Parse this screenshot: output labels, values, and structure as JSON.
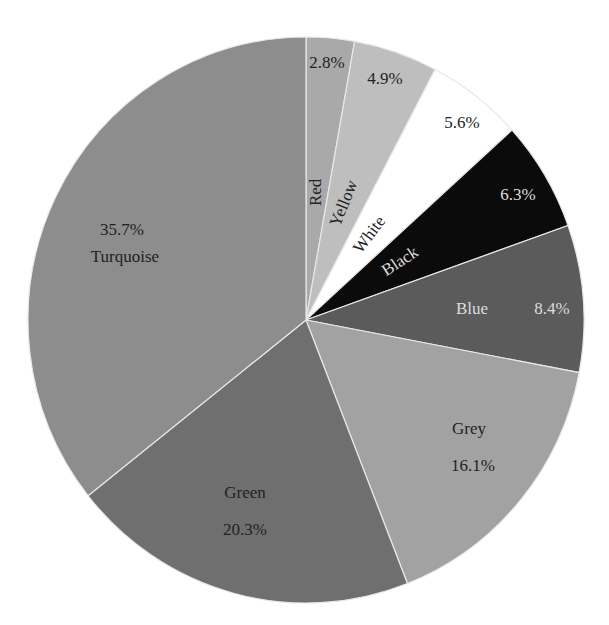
{
  "chart_data": {
    "type": "pie",
    "title": "",
    "start_angle_deg": 0,
    "direction": "clockwise",
    "slices": [
      {
        "label": "Red",
        "value": 2.8,
        "display": "2.8%",
        "color": "#a9a9a9"
      },
      {
        "label": "Yellow",
        "value": 4.9,
        "display": "4.9%",
        "color": "#bebebe"
      },
      {
        "label": "White",
        "value": 5.6,
        "display": "5.6%",
        "color": "#ffffff"
      },
      {
        "label": "Black",
        "value": 6.3,
        "display": "6.3%",
        "color": "#0b0b0b"
      },
      {
        "label": "Blue",
        "value": 8.4,
        "display": "8.4%",
        "color": "#5b5b5b"
      },
      {
        "label": "Grey",
        "value": 16.1,
        "display": "16.1%",
        "color": "#a2a2a2"
      },
      {
        "label": "Green",
        "value": 20.3,
        "display": "20.3%",
        "color": "#6f6f6f"
      },
      {
        "label": "Turquoise",
        "value": 35.7,
        "display": "35.7%",
        "color": "#8d8d8d"
      }
    ],
    "categories": [
      "Red",
      "Yellow",
      "White",
      "Black",
      "Blue",
      "Grey",
      "Green",
      "Turquoise"
    ],
    "values": [
      2.8,
      4.9,
      5.6,
      6.3,
      8.4,
      16.1,
      20.3,
      35.7
    ],
    "legend": "none (labels on slices)"
  }
}
